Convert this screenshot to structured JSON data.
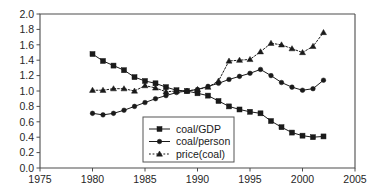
{
  "chart_data": {
    "type": "line",
    "title": "",
    "subtitle": "",
    "xlabel": "",
    "ylabel": "",
    "xlim": [
      1975,
      2005
    ],
    "ylim": [
      0.0,
      2.0
    ],
    "x_ticks": [
      "1975",
      "1980",
      "1985",
      "1990",
      "1995",
      "2000",
      "2005"
    ],
    "x_tick_values": [
      1975,
      1980,
      1985,
      1990,
      1995,
      2000,
      2005
    ],
    "y_ticks": [
      "0.0",
      "0.2",
      "0.4",
      "0.6",
      "0.8",
      "1.0",
      "1.2",
      "1.4",
      "1.6",
      "1.8",
      "2.0"
    ],
    "y_tick_values": [
      0.0,
      0.2,
      0.4,
      0.6,
      0.8,
      1.0,
      1.2,
      1.4,
      1.6,
      1.8,
      2.0
    ],
    "grid": false,
    "legend_position": "bottom-center-inside",
    "x": [
      1980,
      1981,
      1982,
      1983,
      1984,
      1985,
      1986,
      1987,
      1988,
      1989,
      1990,
      1991,
      1992,
      1993,
      1994,
      1995,
      1996,
      1997,
      1998,
      1999,
      2000,
      2001,
      2002
    ],
    "series": [
      {
        "name": "coal/GDP",
        "marker": "square",
        "linestyle": "solid",
        "color": "#1a1a1a",
        "values": [
          1.48,
          1.39,
          1.33,
          1.27,
          1.18,
          1.13,
          1.1,
          1.05,
          1.01,
          1.0,
          0.97,
          0.94,
          0.87,
          0.8,
          0.76,
          0.73,
          0.71,
          0.61,
          0.53,
          0.46,
          0.42,
          0.4,
          0.41
        ]
      },
      {
        "name": "coal/person",
        "marker": "circle",
        "linestyle": "solid",
        "color": "#1a1a1a",
        "values": [
          0.71,
          0.69,
          0.71,
          0.75,
          0.8,
          0.85,
          0.9,
          0.94,
          0.98,
          1.0,
          1.02,
          1.06,
          1.1,
          1.15,
          1.19,
          1.23,
          1.28,
          1.2,
          1.11,
          1.05,
          1.01,
          1.03,
          1.14
        ]
      },
      {
        "name": "price(coal)",
        "marker": "triangle",
        "linestyle": "dotted",
        "color": "#1a1a1a",
        "values": [
          1.01,
          1.01,
          1.03,
          1.03,
          1.0,
          1.07,
          1.04,
          0.99,
          1.0,
          1.0,
          1.02,
          1.05,
          1.13,
          1.39,
          1.4,
          1.41,
          1.51,
          1.62,
          1.6,
          1.55,
          1.5,
          1.58,
          1.76
        ]
      }
    ]
  },
  "legend": {
    "entries": [
      {
        "label": "coal/GDP"
      },
      {
        "label": "coal/person"
      },
      {
        "label": "price(coal)"
      }
    ]
  }
}
